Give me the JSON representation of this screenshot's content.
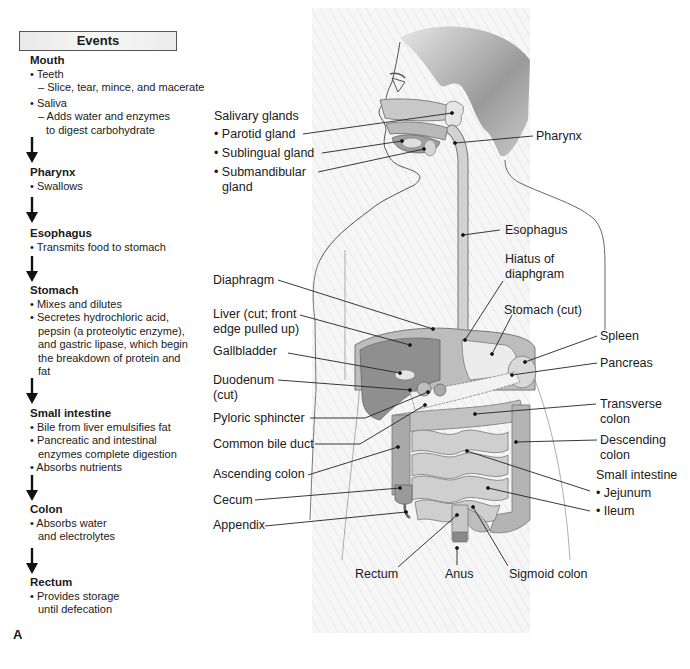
{
  "events": {
    "header": "Events",
    "stages": [
      {
        "title": "Mouth",
        "items": [
          {
            "bullet": "Teeth",
            "sub": [
              "Slice, tear, mince, and macerate"
            ]
          },
          {
            "bullet": "Saliva",
            "sub": [
              "Adds water and enzymes",
              "to digest carbohydrate"
            ]
          }
        ]
      },
      {
        "title": "Pharynx",
        "items": [
          {
            "bullet": "Swallows"
          }
        ]
      },
      {
        "title": "Esophagus",
        "items": [
          {
            "bullet": "Transmits food to stomach"
          }
        ]
      },
      {
        "title": "Stomach",
        "items": [
          {
            "bullet": "Mixes and dilutes"
          },
          {
            "bullet": "Secretes hydrochloric acid,",
            "cont": [
              "pepsin (a proteolytic enzyme),",
              "and gastric lipase, which begin",
              "the breakdown of protein and",
              "fat"
            ]
          }
        ]
      },
      {
        "title": "Small intestine",
        "items": [
          {
            "bullet": "Bile from liver emulsifies fat"
          },
          {
            "bullet": "Pancreatic and intestinal",
            "cont": [
              "enzymes complete digestion"
            ]
          },
          {
            "bullet": "Absorbs nutrients"
          }
        ]
      },
      {
        "title": "Colon",
        "items": [
          {
            "bullet": "Absorbs water",
            "cont": [
              "and electrolytes"
            ]
          }
        ]
      },
      {
        "title": "Rectum",
        "items": [
          {
            "bullet": "Provides storage",
            "cont": [
              "until defecation"
            ]
          }
        ]
      }
    ],
    "figure_letter": "A"
  },
  "labels": {
    "salivary_glands": "Salivary glands",
    "parotid": "Parotid gland",
    "sublingual": "Sublingual gland",
    "submandibular_1": "Submandibular",
    "submandibular_2": "gland",
    "pharynx": "Pharynx",
    "esophagus": "Esophagus",
    "hiatus_1": "Hiatus of",
    "hiatus_2": "diaphgram",
    "diaphragm": "Diaphragm",
    "liver_1": "Liver (cut; front",
    "liver_2": "edge pulled up)",
    "stomach": "Stomach (cut)",
    "spleen": "Spleen",
    "gallbladder": "Gallbladder",
    "pancreas": "Pancreas",
    "duodenum_1": "Duodenum",
    "duodenum_2": "(cut)",
    "transverse_1": "Transverse",
    "transverse_2": "colon",
    "pyloric": "Pyloric sphincter",
    "common_bile": "Common bile duct",
    "descending_1": "Descending",
    "descending_2": "colon",
    "ascending": "Ascending colon",
    "small_intestine": "Small intestine",
    "jejunum": "Jejunum",
    "ileum": "Ileum",
    "cecum": "Cecum",
    "appendix": "Appendix",
    "rectum": "Rectum",
    "anus": "Anus",
    "sigmoid": "Sigmoid colon"
  }
}
